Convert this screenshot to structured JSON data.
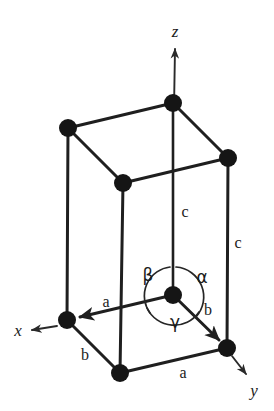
{
  "figure": {
    "type": "crystal-unit-cell-diagram",
    "colors": {
      "background": "#ffffff",
      "ink": "#1b1b1b",
      "node_fill": "#151515",
      "edge_stroke": "#1f1f1f",
      "axis_stroke": "#2a2a2a",
      "arc_stroke": "#262626"
    },
    "geometry": {
      "node_radius": 8.5,
      "edge_width": 3,
      "axis_width": 2,
      "arc_width": 1.6,
      "vertices": {
        "origin_bottom_back": [
          173,
          295
        ],
        "bottom_left": [
          67,
          320
        ],
        "bottom_front": [
          120,
          373
        ],
        "bottom_right": [
          227,
          348
        ],
        "top_back": [
          173,
          103
        ],
        "top_left": [
          68,
          128
        ],
        "top_front": [
          123,
          183
        ],
        "top_right": [
          228,
          158
        ]
      }
    },
    "axes": [
      {
        "name": "z",
        "label": "z",
        "label_pos": [
          175,
          31
        ],
        "from": [
          173,
          103
        ],
        "to": [
          175,
          47
        ],
        "direction": "up"
      },
      {
        "name": "x",
        "label": "x",
        "label_pos": [
          18,
          330
        ],
        "from": [
          67,
          320
        ],
        "to": [
          30,
          329
        ],
        "direction": "left"
      },
      {
        "name": "y",
        "label": "y",
        "label_pos": [
          254,
          390
        ],
        "from": [
          227,
          348
        ],
        "to": [
          245,
          372
        ],
        "direction": "down-right"
      }
    ],
    "edge_labels": [
      {
        "name": "a-top-left-edge",
        "text": "a",
        "pos": [
          106,
          302
        ]
      },
      {
        "name": "b-right-edge",
        "text": "b",
        "pos": [
          208,
          310
        ]
      },
      {
        "name": "b-bottom-left-edge",
        "text": "b",
        "pos": [
          85,
          355
        ]
      },
      {
        "name": "a-bottom-front-edge",
        "text": "a",
        "pos": [
          183,
          373
        ]
      },
      {
        "name": "c-inner-vertical-edge",
        "text": "c",
        "pos": [
          185,
          212
        ]
      },
      {
        "name": "c-right-vertical-edge",
        "text": "c",
        "pos": [
          238,
          243
        ]
      }
    ],
    "angle_labels": [
      {
        "name": "alpha",
        "text": "α",
        "pos": [
          202,
          277
        ]
      },
      {
        "name": "beta",
        "text": "β",
        "pos": [
          148,
          275
        ]
      },
      {
        "name": "gamma",
        "text": "γ",
        "pos": [
          175,
          322
        ]
      }
    ],
    "lattice_parameters": {
      "lengths": [
        "a",
        "b",
        "c"
      ],
      "angles": [
        "α",
        "β",
        "γ"
      ]
    }
  }
}
